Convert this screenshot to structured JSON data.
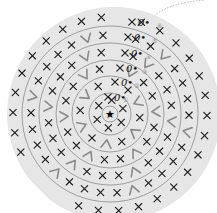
{
  "diagram": {
    "type": "crochet-round-chart",
    "center": {
      "x": 110,
      "y": 114,
      "symbol": "★"
    },
    "disc_color": "#e6e6e6",
    "ring_color": "#8c8c8c",
    "ring_radii": [
      21,
      38,
      54,
      71,
      88
    ],
    "disc_radius": 107,
    "start_marker": "0•",
    "round_labels": [
      {
        "num": "①",
        "x": 123,
        "y": 102
      },
      {
        "num": "②",
        "x": 134,
        "y": 88
      },
      {
        "num": "③",
        "x": 142,
        "y": 74
      },
      {
        "num": "④",
        "x": 146,
        "y": 59
      },
      {
        "num": "⑤",
        "x": 152,
        "y": 43
      },
      {
        "num": "⑥",
        "x": 157,
        "y": 28
      }
    ],
    "start_points": [
      {
        "x": 114,
        "y": 101
      },
      {
        "x": 121,
        "y": 86
      },
      {
        "x": 126,
        "y": 72
      },
      {
        "x": 131,
        "y": 57
      },
      {
        "x": 134,
        "y": 41
      },
      {
        "x": 138,
        "y": 26
      }
    ],
    "legend": {
      "x_symbol": "single crochet",
      "v_symbol": "increase"
    }
  }
}
